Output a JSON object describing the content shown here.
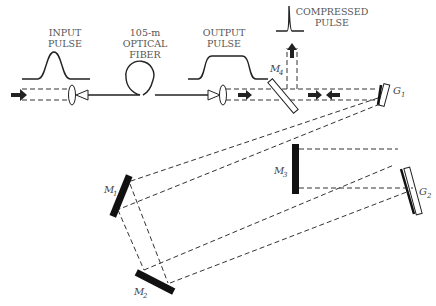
{
  "labels": {
    "input_pulse": [
      "INPUT",
      "PULSE"
    ],
    "fiber": [
      "105-m",
      "OPTICAL",
      "FIBER"
    ],
    "output_pulse": [
      "OUTPUT",
      "PULSE"
    ],
    "compressed_pulse": [
      "COMPRESSED",
      "PULSE"
    ],
    "m1": "M",
    "m1_sub": "1",
    "m2": "M",
    "m2_sub": "2",
    "m3": "M",
    "m3_sub": "3",
    "m4": "M",
    "m4_sub": "4",
    "g1": "G",
    "g1_sub": "1",
    "g2": "G",
    "g2_sub": "2"
  },
  "colors": {
    "ink": "#222222",
    "label": "#555555",
    "background": "#ffffff"
  }
}
